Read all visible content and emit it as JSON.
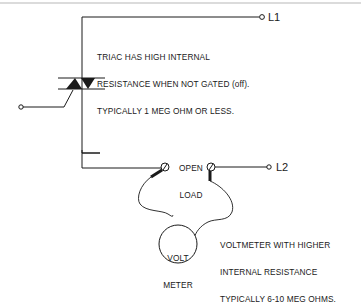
{
  "diagram": {
    "type": "circuit-schematic",
    "terminals": {
      "l1": {
        "label": "L1"
      },
      "l2": {
        "label": "L2"
      }
    },
    "components": {
      "triac": {
        "name": "TRIAC"
      },
      "voltmeter": {
        "line1": "VOLT",
        "line2": "METER"
      },
      "open_load": {
        "line1": "OPEN",
        "line2": "LOAD"
      }
    },
    "annotations": {
      "triac_note": {
        "line1": "TRIAC HAS HIGH INTERNAL",
        "line2": "RESISTANCE WHEN NOT GATED (off).",
        "line3": "TYPICALLY 1 MEG OHM OR LESS."
      },
      "voltmeter_note": {
        "line1": "VOLTMETER WITH HIGHER",
        "line2": "INTERNAL RESISTANCE",
        "line3": "TYPICALLY 6-10 MEG OHMS."
      }
    },
    "colors": {
      "line": "#1a1a1a",
      "border": "#b8b8b8",
      "background": "#ffffff"
    }
  }
}
